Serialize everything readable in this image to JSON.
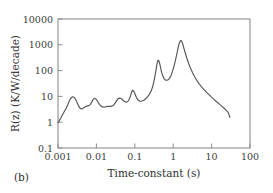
{
  "figure": {
    "panel_label": "(b)",
    "background_color": "#ffffff",
    "frame_color": "#8d8d8d",
    "curve_color": "#55555a"
  },
  "chart_data": {
    "type": "line",
    "title": "",
    "subtitle": "",
    "xlabel": "Time-constant (s)",
    "ylabel": "R(z) (K/W/decade)",
    "xscale": "log",
    "yscale": "log",
    "xlim": [
      0.001,
      100
    ],
    "ylim": [
      0.1,
      10000
    ],
    "grid": false,
    "legend": null,
    "x_tick_labels": [
      "0.001",
      "0.01",
      "0.1",
      "1",
      "10",
      "100"
    ],
    "x_tick_values": [
      0.001,
      0.01,
      0.1,
      1,
      10,
      100
    ],
    "y_tick_labels": [
      "0.1",
      "1",
      "10",
      "100",
      "1000",
      "10000"
    ],
    "y_tick_values": [
      0.1,
      1,
      10,
      100,
      1000,
      10000
    ],
    "series": [
      {
        "name": "R(z) structure function derivative",
        "x": [
          0.001,
          0.00108,
          0.00118,
          0.0013,
          0.00145,
          0.00163,
          0.00182,
          0.002,
          0.0022,
          0.0024,
          0.0026,
          0.00285,
          0.0031,
          0.0034,
          0.0037,
          0.004,
          0.0044,
          0.0048,
          0.0053,
          0.0058,
          0.0064,
          0.007,
          0.0077,
          0.0084,
          0.0092,
          0.01,
          0.011,
          0.012,
          0.0132,
          0.0145,
          0.016,
          0.0175,
          0.0193,
          0.021,
          0.023,
          0.0255,
          0.028,
          0.031,
          0.034,
          0.037,
          0.041,
          0.045,
          0.049,
          0.054,
          0.059,
          0.065,
          0.071,
          0.078,
          0.083,
          0.088,
          0.095,
          0.103,
          0.112,
          0.122,
          0.133,
          0.145,
          0.16,
          0.175,
          0.195,
          0.215,
          0.24,
          0.265,
          0.29,
          0.315,
          0.34,
          0.36,
          0.38,
          0.4,
          0.42,
          0.44,
          0.47,
          0.5,
          0.54,
          0.58,
          0.63,
          0.68,
          0.74,
          0.8,
          0.88,
          0.96,
          1.05,
          1.15,
          1.25,
          1.35,
          1.45,
          1.55,
          1.65,
          1.78,
          1.92,
          2.1,
          2.3,
          2.55,
          2.85,
          3.2,
          3.6,
          4.1,
          4.7,
          5.4,
          6.2,
          7.2,
          8.4,
          9.8,
          11.5,
          13.5,
          16.0,
          19.0,
          23.0,
          27.0,
          30.0
        ],
        "y": [
          0.95,
          1.15,
          1.45,
          1.9,
          2.55,
          3.5,
          5.0,
          7.0,
          8.8,
          9.7,
          9.3,
          7.8,
          6.0,
          4.4,
          3.6,
          3.25,
          3.35,
          3.7,
          4.1,
          4.3,
          4.4,
          4.9,
          6.4,
          7.9,
          8.4,
          7.6,
          6.1,
          4.9,
          4.2,
          3.9,
          3.85,
          3.95,
          4.1,
          4.15,
          4.1,
          4.2,
          4.6,
          5.6,
          7.0,
          8.2,
          8.6,
          8.1,
          7.1,
          6.3,
          6.0,
          6.2,
          7.6,
          11.0,
          15.0,
          17.5,
          15.5,
          11.5,
          8.6,
          7.2,
          6.6,
          6.5,
          6.8,
          7.3,
          8.3,
          9.6,
          12.0,
          16.0,
          23.0,
          38.0,
          70.0,
          115.0,
          190.0,
          250.0,
          245.0,
          200.0,
          130.0,
          85.0,
          60.0,
          48.0,
          43.0,
          42.0,
          44.0,
          50.0,
          65.0,
          95.0,
          150.0,
          260.0,
          460.0,
          790.0,
          1200.0,
          1480.0,
          1400.0,
          1050.0,
          700.0,
          440.0,
          280.0,
          180.0,
          120.0,
          82.0,
          58.0,
          42.0,
          31.0,
          24.0,
          19.0,
          15.0,
          12.0,
          9.6,
          7.7,
          6.2,
          5.0,
          4.0,
          3.1,
          2.4,
          1.55
        ]
      }
    ]
  }
}
